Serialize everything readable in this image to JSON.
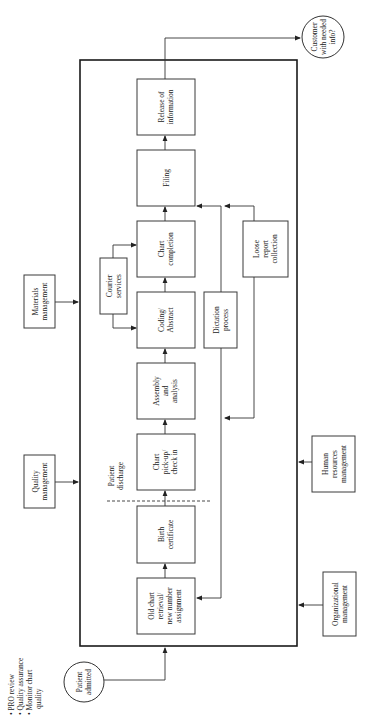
{
  "diagram": {
    "title": "",
    "orientation": "rotated 90° counter-clockwise",
    "start_node": {
      "label_lines": [
        "Patient",
        "admitted"
      ],
      "shape": "circle"
    },
    "end_node": {
      "label_lines": [
        "Customer",
        "with needed",
        "info?"
      ],
      "shape": "circle"
    },
    "notes": {
      "bullets": [
        "PRO review",
        "Quality assurance",
        "Monitor chart",
        "quality"
      ]
    },
    "external_inputs": {
      "quality_management": {
        "label_lines": [
          "Quality",
          "management"
        ]
      },
      "materials_management": {
        "label_lines": [
          "Materials",
          "management"
        ]
      },
      "human_resources": {
        "label_lines": [
          "Human",
          "resources",
          "management"
        ]
      },
      "organizational": {
        "label_lines": [
          "Organizational",
          "management"
        ]
      }
    },
    "process_steps": [
      {
        "id": "old_chart",
        "label_lines": [
          "Old chart",
          "retrieval/",
          "new number",
          "assignment"
        ]
      },
      {
        "id": "birth_cert",
        "label_lines": [
          "Birth",
          "certificate"
        ]
      },
      {
        "id": "chart_pickup",
        "label_lines": [
          "Chart",
          "pick-up/",
          "check in"
        ]
      },
      {
        "id": "assembly",
        "label_lines": [
          "Assembly",
          "and",
          "analysis"
        ]
      },
      {
        "id": "coding",
        "label_lines": [
          "Coding/",
          "Abstract"
        ]
      },
      {
        "id": "chart_completion",
        "label_lines": [
          "Chart",
          "completion"
        ]
      },
      {
        "id": "filing",
        "label_lines": [
          "Filing"
        ]
      },
      {
        "id": "release",
        "label_lines": [
          "Release of",
          "information"
        ]
      }
    ],
    "support_processes": {
      "courier": {
        "label_lines": [
          "Courier",
          "services"
        ]
      },
      "dictation": {
        "label_lines": [
          "Dictation",
          "process"
        ]
      },
      "loose_report": {
        "label_lines": [
          "Loose",
          "report",
          "collection"
        ]
      }
    },
    "divider": {
      "label_lines": [
        "Patient",
        "discharge"
      ]
    },
    "colors": {
      "stroke": "#333333",
      "background": "#ffffff",
      "text": "#222222"
    }
  }
}
